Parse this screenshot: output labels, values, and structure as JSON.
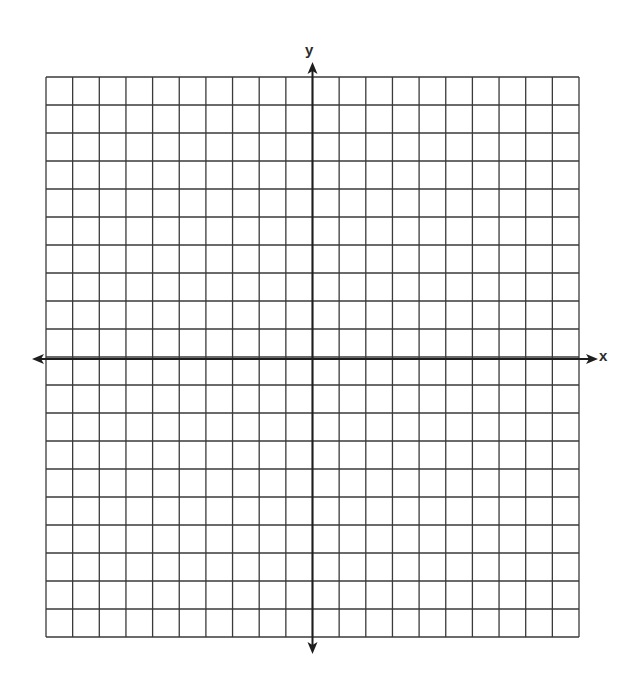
{
  "diagram": {
    "type": "coordinate-plane",
    "x_axis_label": "x",
    "y_axis_label": "y",
    "grid": {
      "columns": 20,
      "rows": 20,
      "columns_left_of_y_axis": 10,
      "columns_right_of_y_axis": 10,
      "rows_above_x_axis": 10,
      "rows_below_x_axis": 10
    },
    "axes": {
      "x_arrows": [
        "left",
        "right"
      ],
      "y_arrows": [
        "up",
        "down"
      ]
    },
    "colors": {
      "grid_line": "#3a3a3a",
      "axis_line": "#1e1e1e",
      "background": "#ffffff"
    }
  }
}
